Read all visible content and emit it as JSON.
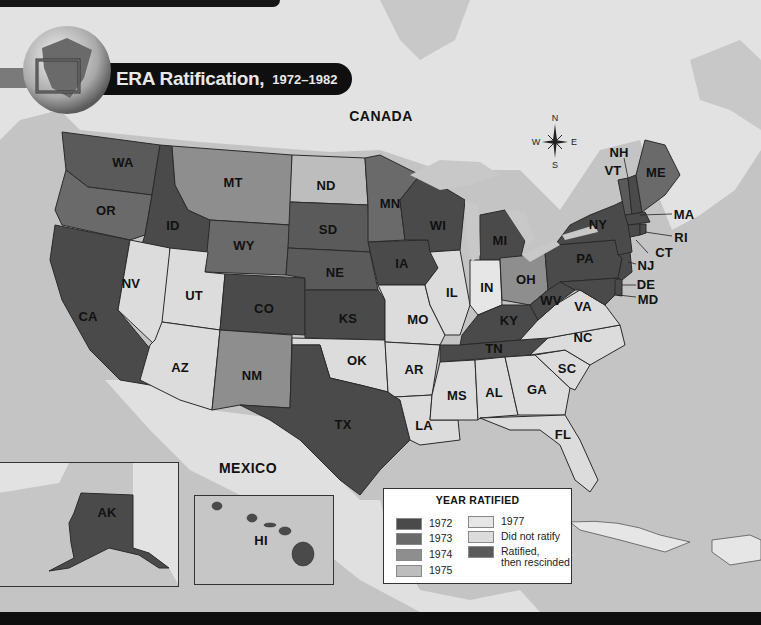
{
  "title": {
    "main": "ERA Ratification,",
    "years": "1972–1982"
  },
  "colors": {
    "water": "#c4c4c4",
    "land_foreign": "#e2e2e2",
    "y1972": "#4a4a4a",
    "y1973": "#6a6a6a",
    "y1974": "#8e8e8e",
    "y1975": "#bdbdbd",
    "y1977": "#e6e6e6",
    "did_not_ratify": "#dcdcdc",
    "rescinded": "#5a5a5a",
    "border": "#2a2a2a"
  },
  "countries": {
    "canada": "CANADA",
    "mexico": "MEXICO"
  },
  "compass": {
    "n": "N",
    "s": "S",
    "e": "E",
    "w": "W"
  },
  "legend": {
    "title": "YEAR RATIFIED",
    "items": [
      {
        "label": "1972",
        "key": "y1972"
      },
      {
        "label": "1973",
        "key": "y1973"
      },
      {
        "label": "1974",
        "key": "y1974"
      },
      {
        "label": "1975",
        "key": "y1975"
      },
      {
        "label": "1977",
        "key": "y1977"
      },
      {
        "label": "Did not ratify",
        "key": "did_not_ratify"
      },
      {
        "label": "Ratified,",
        "label2": "then rescinded",
        "key": "rescinded"
      }
    ]
  },
  "states": {
    "WA": "WA",
    "OR": "OR",
    "CA": "CA",
    "ID": "ID",
    "NV": "NV",
    "MT": "MT",
    "WY": "WY",
    "UT": "UT",
    "AZ": "AZ",
    "CO": "CO",
    "NM": "NM",
    "ND": "ND",
    "SD": "SD",
    "NE": "NE",
    "KS": "KS",
    "OK": "OK",
    "TX": "TX",
    "MN": "MN",
    "IA": "IA",
    "MO": "MO",
    "AR": "AR",
    "LA": "LA",
    "WI": "WI",
    "IL": "IL",
    "MI": "MI",
    "IN": "IN",
    "OH": "OH",
    "KY": "KY",
    "TN": "TN",
    "MS": "MS",
    "AL": "AL",
    "GA": "GA",
    "FL": "FL",
    "SC": "SC",
    "NC": "NC",
    "VA": "VA",
    "WV": "WV",
    "PA": "PA",
    "NY": "NY",
    "VT": "VT",
    "NH": "NH",
    "ME": "ME",
    "MA": "MA",
    "RI": "RI",
    "CT": "CT",
    "NJ": "NJ",
    "DE": "DE",
    "MD": "MD",
    "AK": "AK",
    "HI": "HI"
  }
}
